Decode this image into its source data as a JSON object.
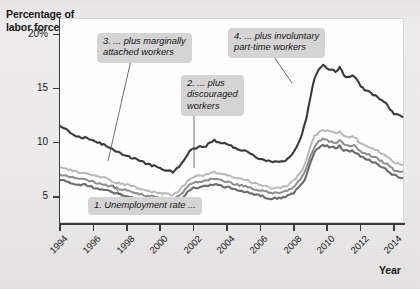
{
  "chart_data": {
    "type": "line",
    "title": "",
    "ylabel": "Percentage of\nlabor force",
    "xlabel": "Year",
    "xlim": [
      1994,
      2014.6
    ],
    "ylim": [
      2.6,
      21.5
    ],
    "grid": false,
    "legend_position": "none",
    "ytick_labels": [
      "20%",
      "15",
      "10",
      "5"
    ],
    "ytick_values": [
      20,
      15,
      10,
      5
    ],
    "xtick_labels": [
      "1994",
      "1996",
      "1998",
      "2000",
      "2002",
      "2004",
      "2006",
      "2008",
      "2010",
      "2012",
      "2014"
    ],
    "xtick_values": [
      1994,
      1996,
      1998,
      2000,
      2002,
      2004,
      2006,
      2008,
      2010,
      2012,
      2014
    ],
    "x": [
      1994,
      1994.25,
      1994.5,
      1994.75,
      1995,
      1995.25,
      1995.5,
      1995.75,
      1996,
      1996.25,
      1996.5,
      1996.75,
      1997,
      1997.25,
      1997.5,
      1997.75,
      1998,
      1998.25,
      1998.5,
      1998.75,
      1999,
      1999.25,
      1999.5,
      1999.75,
      2000,
      2000.25,
      2000.5,
      2000.75,
      2001,
      2001.25,
      2001.5,
      2001.75,
      2002,
      2002.25,
      2002.5,
      2002.75,
      2003,
      2003.25,
      2003.5,
      2003.75,
      2004,
      2004.25,
      2004.5,
      2004.75,
      2005,
      2005.25,
      2005.5,
      2005.75,
      2006,
      2006.25,
      2006.5,
      2006.75,
      2007,
      2007.25,
      2007.5,
      2007.75,
      2008,
      2008.25,
      2008.5,
      2008.75,
      2009,
      2009.25,
      2009.5,
      2009.75,
      2010,
      2010.25,
      2010.5,
      2010.75,
      2011,
      2011.25,
      2011.5,
      2011.75,
      2012,
      2012.25,
      2012.5,
      2012.75,
      2013,
      2013.25,
      2013.5,
      2013.75,
      2014,
      2014.25,
      2014.5
    ],
    "series": [
      {
        "name": "U-6: plus involuntary part-time workers",
        "color": "#3a3a3a",
        "width": 2.1,
        "values": [
          11.6,
          11.3,
          11.1,
          10.8,
          10.6,
          10.4,
          10.5,
          10.3,
          10.2,
          10.0,
          9.9,
          9.7,
          9.5,
          9.3,
          9.1,
          8.9,
          8.8,
          8.6,
          8.5,
          8.3,
          8.2,
          8.0,
          7.9,
          7.8,
          7.6,
          7.5,
          7.4,
          7.3,
          7.6,
          8.1,
          8.6,
          9.2,
          9.5,
          9.6,
          9.6,
          9.7,
          10.0,
          10.2,
          10.1,
          10.0,
          9.8,
          9.7,
          9.5,
          9.4,
          9.3,
          9.1,
          8.9,
          8.7,
          8.5,
          8.3,
          8.3,
          8.2,
          8.3,
          8.3,
          8.4,
          8.6,
          9.2,
          9.9,
          10.8,
          12.2,
          14.2,
          16.0,
          16.7,
          17.1,
          16.9,
          16.7,
          16.6,
          16.9,
          16.2,
          16.1,
          16.2,
          15.9,
          15.2,
          14.9,
          14.7,
          14.4,
          14.3,
          13.9,
          13.6,
          13.1,
          12.7,
          12.6,
          12.4
        ]
      },
      {
        "name": "plus marginally attached workers",
        "color": "#b9b9b9",
        "width": 2.0,
        "values": [
          7.8,
          7.7,
          7.5,
          7.4,
          7.3,
          7.2,
          7.2,
          7.1,
          7.0,
          6.9,
          6.8,
          6.7,
          6.5,
          6.4,
          6.3,
          6.2,
          6.1,
          6.0,
          5.9,
          5.8,
          5.7,
          5.6,
          5.5,
          5.5,
          5.4,
          5.3,
          5.3,
          5.2,
          5.4,
          5.8,
          6.2,
          6.6,
          6.9,
          7.0,
          7.0,
          7.1,
          7.2,
          7.3,
          7.2,
          7.1,
          7.0,
          6.9,
          6.8,
          6.7,
          6.6,
          6.5,
          6.3,
          6.2,
          6.1,
          6.0,
          5.9,
          5.8,
          5.9,
          5.9,
          6.0,
          6.2,
          6.5,
          7.0,
          7.5,
          8.3,
          9.6,
          10.6,
          11.0,
          11.2,
          11.1,
          11.0,
          10.9,
          11.1,
          10.6,
          10.5,
          10.6,
          10.4,
          9.9,
          9.7,
          9.6,
          9.4,
          9.3,
          9.0,
          8.8,
          8.5,
          8.2,
          8.1,
          8.0
        ]
      },
      {
        "name": "plus discouraged workers",
        "color": "#8d8d8d",
        "width": 2.0,
        "values": [
          7.1,
          7.0,
          6.9,
          6.8,
          6.7,
          6.6,
          6.6,
          6.5,
          6.4,
          6.3,
          6.2,
          6.1,
          6.0,
          5.9,
          5.8,
          5.7,
          5.6,
          5.5,
          5.4,
          5.3,
          5.2,
          5.1,
          5.1,
          5.0,
          4.9,
          4.9,
          4.8,
          4.8,
          5.0,
          5.3,
          5.7,
          6.1,
          6.3,
          6.4,
          6.4,
          6.5,
          6.6,
          6.7,
          6.6,
          6.5,
          6.4,
          6.3,
          6.2,
          6.1,
          6.0,
          5.9,
          5.8,
          5.7,
          5.6,
          5.5,
          5.4,
          5.3,
          5.4,
          5.4,
          5.5,
          5.7,
          6.0,
          6.4,
          6.9,
          7.6,
          8.8,
          9.7,
          10.1,
          10.3,
          10.2,
          10.1,
          10.0,
          10.2,
          9.8,
          9.7,
          9.8,
          9.6,
          9.2,
          9.0,
          8.9,
          8.7,
          8.6,
          8.3,
          8.1,
          7.8,
          7.5,
          7.4,
          7.3
        ]
      },
      {
        "name": "Unemployment rate",
        "color": "#6b6b6b",
        "width": 2.1,
        "values": [
          6.6,
          6.5,
          6.4,
          6.3,
          6.2,
          6.1,
          6.1,
          6.0,
          5.9,
          5.8,
          5.7,
          5.6,
          5.5,
          5.4,
          5.3,
          5.2,
          5.1,
          5.0,
          4.9,
          4.8,
          4.7,
          4.6,
          4.6,
          4.5,
          4.4,
          4.4,
          4.3,
          4.3,
          4.5,
          4.8,
          5.2,
          5.6,
          5.8,
          5.9,
          5.9,
          6.0,
          6.1,
          6.2,
          6.1,
          6.0,
          5.9,
          5.8,
          5.7,
          5.6,
          5.5,
          5.4,
          5.3,
          5.2,
          5.1,
          5.0,
          4.9,
          4.8,
          4.9,
          4.9,
          5.0,
          5.2,
          5.4,
          5.8,
          6.2,
          6.9,
          8.2,
          9.1,
          9.6,
          9.8,
          9.7,
          9.6,
          9.5,
          9.7,
          9.3,
          9.2,
          9.3,
          9.1,
          8.7,
          8.5,
          8.4,
          8.2,
          8.1,
          7.8,
          7.6,
          7.3,
          7.0,
          6.9,
          6.8
        ]
      }
    ],
    "annotations": [
      {
        "id": "1",
        "text": "1. Unemployment rate ...",
        "points_to_series": "Unemployment rate",
        "leader": {
          "x1": 122,
          "y1": 197,
          "x2": 113,
          "y2": 185
        }
      },
      {
        "id": "2",
        "text": "2. ... plus\ndiscouraged\nworkers",
        "points_to_series": "plus discouraged workers",
        "leader": {
          "x1": 194,
          "y1": 113,
          "x2": 194,
          "y2": 168
        }
      },
      {
        "id": "3",
        "text": "3. ... plus marginally\nattached workers",
        "points_to_series": "plus marginally attached workers",
        "leader": {
          "x1": 131,
          "y1": 60,
          "x2": 108,
          "y2": 161
        }
      },
      {
        "id": "4",
        "text": "4. ... plus involuntary\npart-time workers",
        "points_to_series": "U-6: plus involuntary part-time workers",
        "leader": {
          "x1": 272,
          "y1": 54,
          "x2": 292,
          "y2": 83
        }
      }
    ]
  }
}
